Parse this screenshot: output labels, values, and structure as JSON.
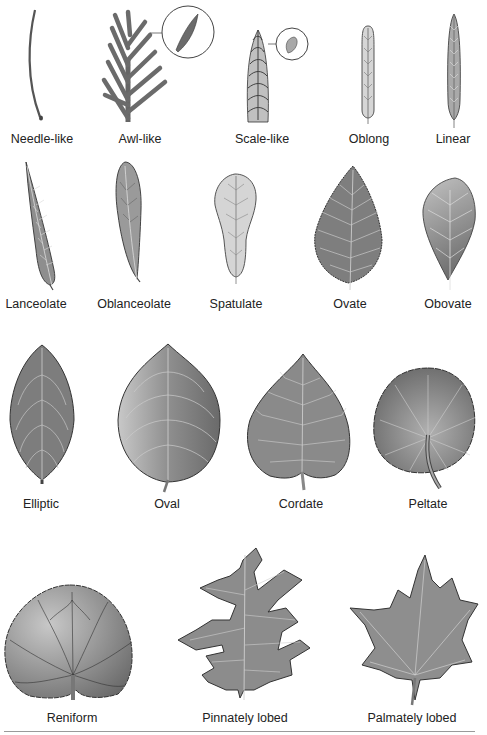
{
  "figure": {
    "colors": {
      "leaf_dark": "#6e6e6e",
      "leaf_mid": "#8c8c8c",
      "leaf_light": "#c9c9c9",
      "vein": "#d8d8d8",
      "outline": "#3a3a3a",
      "text": "#222222"
    },
    "rows": [
      {
        "leaves": [
          {
            "id": "needle-like",
            "label": "Needle-like"
          },
          {
            "id": "awl-like",
            "label": "Awl-like",
            "detail_inset": true
          },
          {
            "id": "scale-like",
            "label": "Scale-like",
            "detail_inset": true
          },
          {
            "id": "oblong",
            "label": "Oblong"
          },
          {
            "id": "linear",
            "label": "Linear"
          }
        ]
      },
      {
        "leaves": [
          {
            "id": "lanceolate",
            "label": "Lanceolate"
          },
          {
            "id": "oblanceolate",
            "label": "Oblanceolate"
          },
          {
            "id": "spatulate",
            "label": "Spatulate"
          },
          {
            "id": "ovate",
            "label": "Ovate"
          },
          {
            "id": "obovate",
            "label": "Obovate"
          }
        ]
      },
      {
        "leaves": [
          {
            "id": "elliptic",
            "label": "Elliptic"
          },
          {
            "id": "oval",
            "label": "Oval"
          },
          {
            "id": "cordate",
            "label": "Cordate"
          },
          {
            "id": "peltate",
            "label": "Peltate"
          }
        ]
      },
      {
        "leaves": [
          {
            "id": "reniform",
            "label": "Reniform"
          },
          {
            "id": "pinnately-lobed",
            "label": "Pinnately lobed"
          },
          {
            "id": "palmately-lobed",
            "label": "Palmately lobed"
          }
        ]
      }
    ]
  }
}
